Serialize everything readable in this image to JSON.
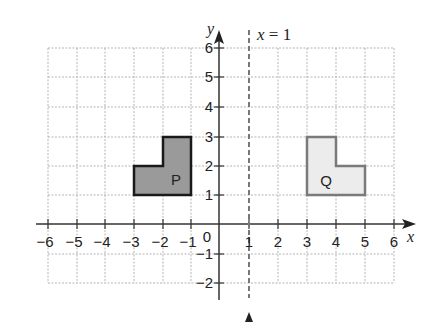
{
  "diagram": {
    "type": "coordinate-grid-reflection",
    "x_axis": {
      "label": "x",
      "min": -6,
      "max": 6,
      "ticks": [
        "−6",
        "−5",
        "−4",
        "−3",
        "−2",
        "−1",
        "1",
        "2",
        "3",
        "4",
        "5",
        "6"
      ]
    },
    "y_axis": {
      "label": "y",
      "min": -2,
      "max": 6,
      "ticks": [
        "6",
        "5",
        "4",
        "3",
        "2",
        "1",
        "−1",
        "−2"
      ]
    },
    "origin_label": "0",
    "mirror_line": {
      "label": "x = 1",
      "x": 1,
      "style": "dashed"
    },
    "shapes": [
      {
        "name": "P",
        "fill": "#9a9a9a",
        "stroke": "#1a1a1a",
        "vertices": [
          [
            -3,
            1
          ],
          [
            -1,
            1
          ],
          [
            -1,
            3
          ],
          [
            -2,
            3
          ],
          [
            -2,
            2
          ],
          [
            -3,
            2
          ]
        ]
      },
      {
        "name": "Q",
        "fill": "#ececec",
        "stroke": "#7a7a7a",
        "vertices": [
          [
            3,
            1
          ],
          [
            5,
            1
          ],
          [
            5,
            2
          ],
          [
            4,
            2
          ],
          [
            4,
            3
          ],
          [
            3,
            3
          ]
        ]
      }
    ]
  }
}
